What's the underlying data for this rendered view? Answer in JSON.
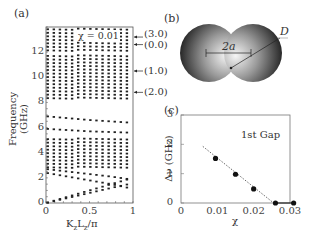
{
  "panels": {
    "a": {
      "label": "(a)"
    },
    "b": {
      "label": "(b)",
      "gap_label": "2a",
      "diameter_label": "D"
    },
    "c": {
      "label": "(c)"
    }
  },
  "chart_data": [
    {
      "id": "a",
      "type": "scatter",
      "title": "",
      "annotation": "χ = 0.01",
      "xlabel": "KzLz/π",
      "ylabel": "Frequency (GHz)",
      "xlim": [
        0,
        1
      ],
      "ylim": [
        0,
        14
      ],
      "xticks": [
        "0",
        "0.5",
        "1"
      ],
      "yticks": [
        "0",
        "2",
        "4",
        "6",
        "8",
        "10",
        "12"
      ],
      "grid": false,
      "band_gaps_GHz": [
        [
          7.0,
          8.3
        ],
        [
          11.7,
          12.1
        ]
      ],
      "bands_description": [
        {
          "name": "lower acoustic branch",
          "x": [
            0,
            0.25,
            0.5,
            0.75,
            0.95
          ],
          "y": [
            0.0,
            0.4,
            0.8,
            1.2,
            1.5
          ]
        },
        {
          "name": "upper acoustic branch",
          "x": [
            0,
            0.25,
            0.5,
            0.75,
            0.95
          ],
          "y": [
            0.0,
            0.5,
            1.0,
            1.5,
            1.9
          ]
        },
        {
          "name": "descending branch 1",
          "x": [
            0,
            0.25,
            0.5,
            0.75,
            0.95
          ],
          "y": [
            2.4,
            2.1,
            1.8,
            1.5,
            1.2
          ]
        },
        {
          "name": "descending branch 2",
          "x": [
            0,
            0.25,
            0.5,
            0.75,
            0.95
          ],
          "y": [
            2.7,
            2.5,
            2.3,
            2.1,
            1.9
          ]
        },
        {
          "name": "dense band 3-5 GHz",
          "y_range": [
            2.8,
            5.3
          ]
        },
        {
          "name": "band ~5.6-6.0",
          "x": [
            0,
            0.5,
            0.95
          ],
          "y": [
            5.9,
            5.7,
            5.6
          ]
        },
        {
          "name": "band ~6.5-6.9",
          "x": [
            0,
            0.5,
            0.95
          ],
          "y": [
            6.9,
            6.6,
            6.4
          ]
        },
        {
          "name": "dense band 8.3-11.7 GHz",
          "y_range": [
            8.3,
            11.7
          ]
        },
        {
          "name": "dense band 12.1-14 GHz",
          "y_range": [
            12.1,
            13.8
          ]
        }
      ],
      "mode_labels": [
        {
          "text": "(3.0)",
          "y": 13.2
        },
        {
          "text": "(0.0)",
          "y": 12.6
        },
        {
          "text": "(1.0)",
          "y": 10.5
        },
        {
          "text": "(2.0)",
          "y": 8.8
        }
      ]
    },
    {
      "id": "c",
      "type": "scatter",
      "title": "",
      "annotation": "1st Gap",
      "xlabel": "χ",
      "ylabel": "Δν (GHz)",
      "xlim": [
        0,
        0.03
      ],
      "ylim": [
        0,
        3
      ],
      "xticks": [
        "0",
        "0.01",
        "0.02",
        "0.03"
      ],
      "yticks": [
        "0",
        "1",
        "2",
        "3"
      ],
      "grid": false,
      "x": [
        0.0095,
        0.015,
        0.02,
        0.026,
        0.031
      ],
      "y": [
        1.52,
        0.98,
        0.48,
        0.0,
        0.0
      ],
      "fit_line": {
        "style": "dotted",
        "x": [
          0.006,
          0.0255
        ],
        "y": [
          1.93,
          0.0
        ]
      }
    }
  ]
}
